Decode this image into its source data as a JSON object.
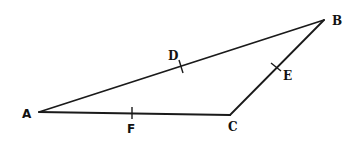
{
  "diagram": {
    "type": "triangle-with-midpoints",
    "vertices": [
      {
        "id": "A",
        "label": "A",
        "x": 39,
        "y": 112
      },
      {
        "id": "B",
        "label": "B",
        "x": 324,
        "y": 20
      },
      {
        "id": "C",
        "label": "C",
        "x": 230,
        "y": 115
      }
    ],
    "edges": [
      {
        "from": "A",
        "to": "B"
      },
      {
        "from": "B",
        "to": "C"
      },
      {
        "from": "A",
        "to": "C"
      }
    ],
    "points": [
      {
        "id": "D",
        "label": "D",
        "on_edge": "AB",
        "x": 181,
        "y": 66
      },
      {
        "id": "E",
        "label": "E",
        "on_edge": "BC",
        "x": 277,
        "y": 67
      },
      {
        "id": "F",
        "label": "F",
        "on_edge": "AC",
        "x": 132,
        "y": 113
      }
    ],
    "colors": {
      "stroke": "#1a1a1a",
      "background": "#ffffff"
    }
  }
}
